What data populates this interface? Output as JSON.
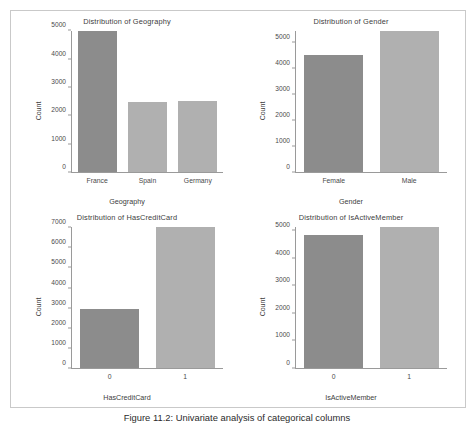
{
  "caption": "Figure 11.2: Univariate analysis of categorical columns",
  "chart_data": [
    {
      "type": "bar",
      "panel": "top-left",
      "title": "Distribution of Geography",
      "xlabel": "Geography",
      "ylabel": "Count",
      "categories": [
        "France",
        "Spain",
        "Germany"
      ],
      "values": [
        5014,
        2477,
        2509
      ],
      "yticks": [
        0,
        1000,
        2000,
        3000,
        4000,
        5000
      ],
      "ytick_labels": [
        "0",
        "1000",
        "2000",
        "3000",
        "4000",
        "5000"
      ],
      "ylim": [
        0,
        5014
      ],
      "grid": false,
      "legend": "none",
      "bar_colors": [
        "#8c8c8c",
        "#b0b0b0",
        "#b0b0b0"
      ]
    },
    {
      "type": "bar",
      "panel": "top-right",
      "title": "Distribution of Gender",
      "xlabel": "Gender",
      "ylabel": "Count",
      "categories": [
        "Female",
        "Male"
      ],
      "values": [
        4543,
        5457
      ],
      "yticks": [
        0,
        1000,
        2000,
        3000,
        4000,
        5000
      ],
      "ytick_labels": [
        "0",
        "1000",
        "2000",
        "3000",
        "4000",
        "5000"
      ],
      "ylim": [
        0,
        5457
      ],
      "grid": false,
      "legend": "none",
      "bar_colors": [
        "#8c8c8c",
        "#b0b0b0"
      ]
    },
    {
      "type": "bar",
      "panel": "bottom-left",
      "title": "Distribution of HasCreditCard",
      "xlabel": "HasCreditCard",
      "ylabel": "Count",
      "categories": [
        "0",
        "1"
      ],
      "values": [
        2945,
        7055
      ],
      "yticks": [
        0,
        1000,
        2000,
        3000,
        4000,
        5000,
        6000,
        7000
      ],
      "ytick_labels": [
        "0",
        "1000",
        "2000",
        "3000",
        "4000",
        "5000",
        "6000",
        "7000"
      ],
      "ylim": [
        0,
        7055
      ],
      "grid": false,
      "legend": "none",
      "bar_colors": [
        "#8c8c8c",
        "#b0b0b0"
      ]
    },
    {
      "type": "bar",
      "panel": "bottom-right",
      "title": "Distribution of IsActiveMember",
      "xlabel": "IsActiveMember",
      "ylabel": "Count",
      "categories": [
        "0",
        "1"
      ],
      "values": [
        4849,
        5151
      ],
      "yticks": [
        0,
        1000,
        2000,
        3000,
        4000,
        5000
      ],
      "ytick_labels": [
        "0",
        "1000",
        "2000",
        "3000",
        "4000",
        "5000"
      ],
      "ylim": [
        0,
        5151
      ],
      "grid": false,
      "legend": "none",
      "bar_colors": [
        "#8c8c8c",
        "#b0b0b0"
      ]
    }
  ]
}
